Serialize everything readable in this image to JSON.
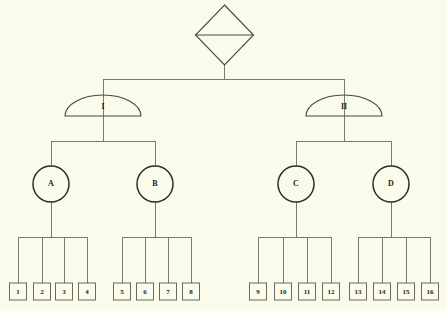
{
  "diagram": {
    "background_color": "#fbfbec",
    "line_color": "#6b6b5a",
    "text_color": "#1d1d14",
    "root": {
      "shape": "diamond",
      "label": "",
      "cx": 224.5,
      "cy": 35,
      "rx": 29,
      "ry": 30,
      "divider": true
    },
    "level1": {
      "shape": "dome",
      "items": [
        {
          "label": "I",
          "cx": 103,
          "cy": 115,
          "rx": 38,
          "ry": 20
        },
        {
          "label": "II",
          "cx": 344,
          "cy": 115,
          "rx": 38,
          "ry": 20
        }
      ]
    },
    "level2": {
      "shape": "circle",
      "items": [
        {
          "label": "A",
          "cx": 51,
          "cy": 184,
          "r": 18,
          "parent": 0
        },
        {
          "label": "B",
          "cx": 155,
          "cy": 184,
          "r": 18,
          "parent": 0
        },
        {
          "label": "C",
          "cx": 296,
          "cy": 184,
          "r": 18,
          "parent": 1
        },
        {
          "label": "D",
          "cx": 391,
          "cy": 184,
          "r": 18,
          "parent": 1
        }
      ]
    },
    "level3": {
      "shape": "rect",
      "box_width": 17,
      "box_height": 17,
      "box_top": 283,
      "items": [
        {
          "label": "1",
          "cx": 18,
          "parent": 0
        },
        {
          "label": "2",
          "cx": 42,
          "parent": 0
        },
        {
          "label": "3",
          "cx": 64,
          "parent": 0
        },
        {
          "label": "4",
          "cx": 87,
          "parent": 0
        },
        {
          "label": "5",
          "cx": 122,
          "parent": 1
        },
        {
          "label": "6",
          "cx": 145,
          "parent": 1
        },
        {
          "label": "7",
          "cx": 168,
          "parent": 1
        },
        {
          "label": "8",
          "cx": 191,
          "parent": 1
        },
        {
          "label": "9",
          "cx": 258,
          "parent": 2
        },
        {
          "label": "10",
          "cx": 283,
          "parent": 2
        },
        {
          "label": "11",
          "cx": 307,
          "parent": 2
        },
        {
          "label": "12",
          "cx": 331,
          "parent": 2
        },
        {
          "label": "13",
          "cx": 358,
          "parent": 3
        },
        {
          "label": "14",
          "cx": 382,
          "parent": 3
        },
        {
          "label": "15",
          "cx": 406,
          "parent": 3
        },
        {
          "label": "16",
          "cx": 430,
          "parent": 3
        }
      ]
    },
    "bus_lines": {
      "root_bus_y": 79,
      "level1_bus_y": 141,
      "level2_bus_y": 237
    }
  }
}
